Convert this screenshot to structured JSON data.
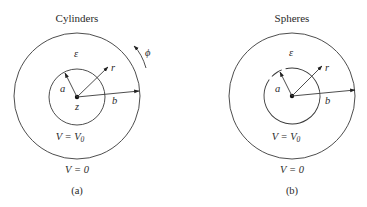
{
  "figure": {
    "panels": [
      {
        "id": "a",
        "title": "Cylinders",
        "caption": "(a)",
        "permittivity_label": "ε",
        "inner_radius_label": "a",
        "outer_radius_label": "b",
        "radial_label": "r",
        "axis_label": "z",
        "azimuth_label": "ϕ",
        "inner_potential": {
          "lhs": "V = V",
          "subscript": "0"
        },
        "outer_potential": "V = 0"
      },
      {
        "id": "b",
        "title": "Spheres",
        "caption": "(b)",
        "permittivity_label": "ε",
        "inner_radius_label": "a",
        "outer_radius_label": "b",
        "radial_label": "r",
        "inner_potential": {
          "lhs": "V = V",
          "subscript": "0"
        },
        "outer_potential": "V = 0"
      }
    ]
  }
}
